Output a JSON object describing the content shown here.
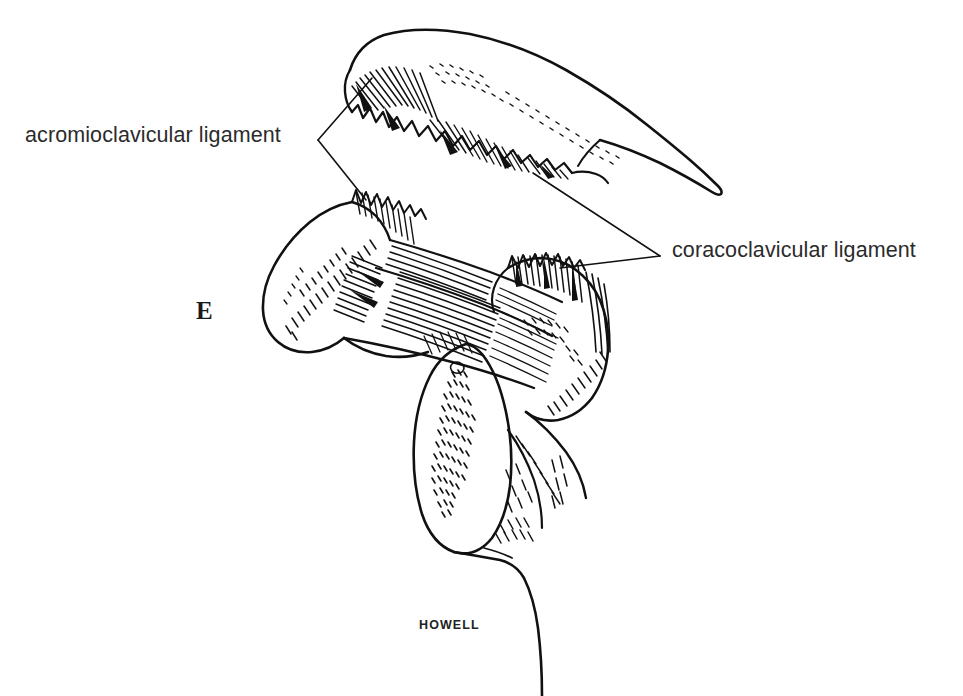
{
  "figure": {
    "panel_letter": "E",
    "artist_signature": "HOWELL",
    "background_color": "#ffffff",
    "ink_color": "#111111",
    "text_color": "#2b2b2b",
    "illustration_type": "pen-and-ink anatomical line drawing",
    "width": 963,
    "height": 696
  },
  "labels": [
    {
      "id": "acromioclavicular",
      "text": "acromioclavicular ligament",
      "x": 25,
      "y": 123,
      "leader_vertex": [
        318,
        140
      ],
      "leader_targets": [
        [
          372,
          78
        ],
        [
          366,
          200
        ]
      ]
    },
    {
      "id": "coracoclavicular",
      "text": "coracoclavicular ligament",
      "x": 672,
      "y": 238,
      "leader_vertex": [
        660,
        256
      ],
      "leader_targets": [
        [
          533,
          173
        ],
        [
          560,
          268
        ]
      ]
    }
  ],
  "structures": [
    {
      "name": "clavicle",
      "description": "upper bone with torn ligament stumps and stippled shading"
    },
    {
      "name": "coracoid-process",
      "description": "hook-shaped process at left with contour hatching"
    },
    {
      "name": "acromion",
      "description": "right lateral process with dense hatching"
    },
    {
      "name": "coracoclavicular-ligament-band",
      "description": "fibrous band spanning coracoid to acromion region"
    },
    {
      "name": "humeral-head",
      "description": "oval stippled head below the ligament band"
    },
    {
      "name": "humeral-shaft",
      "description": "shaft descending to the lower edge"
    }
  ]
}
